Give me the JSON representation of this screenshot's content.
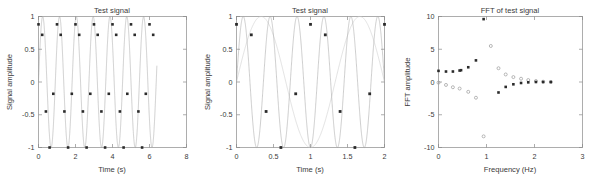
{
  "figure": {
    "panel_count": 3,
    "background": "#ffffff",
    "line_color": "#a6a6a6",
    "marker_color": "#2b2b2b",
    "open_marker_color": "#9a9a9a",
    "axis_color": "#8a8a8a"
  },
  "chart_data": [
    {
      "type": "line",
      "title": "Test signal",
      "xlabel": "Time (s)",
      "ylabel": "Signal amplitude",
      "xlim": [
        0,
        8
      ],
      "ylim": [
        -1,
        1
      ],
      "xticks": [
        0,
        2,
        4,
        6,
        8
      ],
      "xtick_labels": [
        "0",
        "2",
        "4",
        "6",
        "8"
      ],
      "yticks": [
        -1,
        -0.5,
        0,
        0.5,
        1
      ],
      "ytick_labels": [
        "-1",
        "-0.5",
        "0",
        "0.5",
        "1"
      ],
      "grid": false,
      "legend": "none",
      "series": [
        {
          "name": "continuous signal",
          "style": "line",
          "description": "High-frequency sinusoid sin(2*pi*f*t) with f about 1.1 Hz rendered over 0 to 6.4 s, appearing as a dense band of vertical strokes",
          "x_start": 0,
          "x_end": 6.4,
          "frequency_hz": 1.1,
          "amplitude": 1
        },
        {
          "name": "sampled points",
          "style": "marker-filled",
          "description": "Aliased samples taken every 0.2 s over 0 to 6.4 s producing a slow repeating pattern of 5 levels",
          "sample_interval_s": 0.2,
          "x": [
            0.0,
            0.2,
            0.4,
            0.6,
            0.8,
            1.0,
            1.2,
            1.4,
            1.6,
            1.8,
            2.0,
            2.2,
            2.4,
            2.6,
            2.8,
            3.0,
            3.2,
            3.4,
            3.6,
            3.8,
            4.0,
            4.2,
            4.4,
            4.6,
            4.8,
            5.0,
            5.2,
            5.4,
            5.6,
            5.8,
            6.0,
            6.2
          ],
          "y": [
            0.88,
            0.72,
            -0.45,
            -1.0,
            -0.18,
            0.88,
            0.72,
            -0.45,
            -1.0,
            -0.18,
            0.88,
            0.72,
            -0.45,
            -1.0,
            -0.18,
            0.88,
            0.72,
            -0.45,
            -1.0,
            -0.18,
            0.88,
            0.72,
            -0.45,
            -1.0,
            -0.18,
            0.88,
            0.72,
            -0.45,
            -1.0,
            -0.18,
            0.88,
            0.72
          ]
        }
      ]
    },
    {
      "type": "line",
      "title": "Test signal",
      "xlabel": "Time (s)",
      "ylabel": "Signal amplitude",
      "xlim": [
        0,
        2
      ],
      "ylim": [
        -1,
        1
      ],
      "xticks": [
        0,
        0.5,
        1,
        1.5,
        2
      ],
      "xtick_labels": [
        "0",
        "0.5",
        "1",
        "1.5",
        "2"
      ],
      "yticks": [
        -1,
        -0.5,
        0,
        0.5,
        1
      ],
      "ytick_labels": [
        "-1",
        "-0.5",
        "0",
        "0.5",
        "1"
      ],
      "grid": false,
      "legend": "none",
      "series": [
        {
          "name": "continuous signal",
          "style": "line",
          "description": "Zoomed view of the same sinusoid over 0 to 2 s, about 5.5 cycles visible",
          "frequency_hz": 2.75,
          "amplitude": 1
        },
        {
          "name": "aliased reconstruction",
          "style": "line-light",
          "description": "Low frequency alias curve through the sampled points",
          "frequency_hz": 0.75,
          "amplitude": 1
        },
        {
          "name": "sampled points",
          "style": "marker-filled",
          "sample_interval_s": 0.2,
          "x": [
            0.0,
            0.2,
            0.4,
            0.6,
            0.8,
            1.0,
            1.2,
            1.4,
            1.6,
            1.8,
            2.0
          ],
          "y": [
            0.88,
            0.72,
            -0.45,
            -1.0,
            -0.18,
            0.88,
            0.72,
            -0.45,
            -1.0,
            -0.18,
            0.88
          ]
        }
      ]
    },
    {
      "type": "scatter",
      "title": "FFT of test signal",
      "xlabel": "Frequency (Hz)",
      "ylabel": "FFT amplitude",
      "xlim": [
        0,
        3
      ],
      "ylim": [
        -10,
        10
      ],
      "xticks": [
        0,
        1,
        2,
        3
      ],
      "xtick_labels": [
        "0",
        "1",
        "2",
        "3"
      ],
      "yticks": [
        -10,
        -5,
        0,
        5,
        10
      ],
      "ytick_labels": [
        "-10",
        "-5",
        "0",
        "5",
        "10"
      ],
      "grid": false,
      "legend": "none",
      "series": [
        {
          "name": "real part",
          "style": "marker-filled",
          "x": [
            0.0,
            0.156,
            0.3,
            0.44,
            0.47,
            0.62,
            0.78,
            0.94,
            1.25,
            1.4,
            1.56,
            1.72,
            1.87,
            2.03,
            2.18,
            2.34
          ],
          "y": [
            1.7,
            1.6,
            1.6,
            1.75,
            1.8,
            2.25,
            3.3,
            9.6,
            -1.6,
            -0.75,
            -0.35,
            -0.15,
            -0.05,
            0.0,
            0.0,
            0.0
          ]
        },
        {
          "name": "imaginary part",
          "style": "marker-open",
          "x": [
            0.0,
            0.156,
            0.3,
            0.44,
            0.62,
            0.78,
            0.94,
            1.09,
            1.25,
            1.4,
            1.56,
            1.72,
            1.87,
            2.03,
            2.18,
            2.34
          ],
          "y": [
            -0.1,
            -0.45,
            -0.8,
            -1.0,
            -1.5,
            -2.4,
            -8.3,
            5.5,
            2.1,
            1.15,
            0.75,
            0.5,
            0.3,
            0.15,
            0.05,
            0.0
          ]
        }
      ]
    }
  ]
}
